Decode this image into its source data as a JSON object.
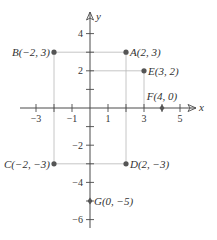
{
  "diagram": {
    "type": "coordinate-plane",
    "axes": {
      "x_label": "x",
      "y_label": "y"
    },
    "x_ticks": [
      {
        "v": -3,
        "label": "−3"
      },
      {
        "v": -2,
        "label": ""
      },
      {
        "v": -1,
        "label": "−1"
      },
      {
        "v": 1,
        "label": "1"
      },
      {
        "v": 2,
        "label": ""
      },
      {
        "v": 3,
        "label": "3"
      },
      {
        "v": 4,
        "label": ""
      },
      {
        "v": 5,
        "label": "5"
      }
    ],
    "y_ticks": [
      {
        "v": 4,
        "label": "4"
      },
      {
        "v": 3,
        "label": ""
      },
      {
        "v": 2,
        "label": "2"
      },
      {
        "v": 1,
        "label": ""
      },
      {
        "v": -1,
        "label": ""
      },
      {
        "v": -2,
        "label": "−2"
      },
      {
        "v": -3,
        "label": ""
      },
      {
        "v": -4,
        "label": "−4"
      },
      {
        "v": -5,
        "label": ""
      },
      {
        "v": -6,
        "label": "−6"
      }
    ],
    "points": [
      {
        "name": "A",
        "x": 2,
        "y": 3,
        "label": "A(2, 3)",
        "side": "right"
      },
      {
        "name": "B",
        "x": -2,
        "y": 3,
        "label": "B(−2, 3)",
        "side": "left"
      },
      {
        "name": "C",
        "x": -2,
        "y": -3,
        "label": "C(−2, −3)",
        "side": "left"
      },
      {
        "name": "D",
        "x": 2,
        "y": -3,
        "label": "D(2, −3)",
        "side": "right"
      },
      {
        "name": "E",
        "x": 3,
        "y": 2,
        "label": "E(3, 2)",
        "side": "right"
      },
      {
        "name": "F",
        "x": 4,
        "y": 0,
        "label": "F(4, 0)",
        "side": "above"
      },
      {
        "name": "G",
        "x": 0,
        "y": -5,
        "label": "G(0, −5)",
        "side": "right"
      }
    ],
    "colors": {
      "axis": "#4a4a4a",
      "guide": "#b8b8b8",
      "point": "#555555",
      "text": "#333333"
    }
  }
}
